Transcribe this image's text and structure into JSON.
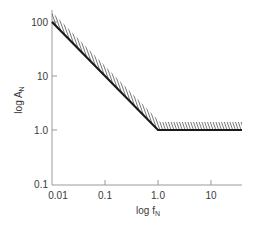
{
  "chart_data": {
    "type": "line",
    "title": "",
    "xlabel": "log f",
    "xlabel_subscript": "N",
    "ylabel": "log A",
    "ylabel_subscript": "N",
    "x_scale": "log",
    "y_scale": "log",
    "xlim": [
      0.01,
      40
    ],
    "ylim": [
      0.1,
      140
    ],
    "x_ticks": [
      0.01,
      0.1,
      1.0,
      10
    ],
    "x_tick_labels": [
      "0.01",
      "0.1",
      "1.0",
      "10"
    ],
    "y_ticks": [
      0.1,
      1.0,
      10,
      100
    ],
    "y_tick_labels": [
      "0.1",
      "1.0",
      "10",
      "100"
    ],
    "grid": false,
    "legend": null,
    "series": [
      {
        "name": "boundary",
        "x": [
          0.01,
          1.0,
          40
        ],
        "y": [
          100,
          1.0,
          1.0
        ],
        "style": "solid-black-thick",
        "hatched_side": "above"
      }
    ],
    "colors": {
      "line": "#1a1a1a",
      "axis": "#9a9a9a",
      "hatch": "#555555",
      "text": "#3a3a3a"
    }
  }
}
